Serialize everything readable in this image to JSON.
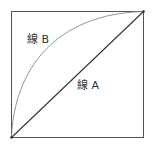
{
  "diagram": {
    "box": {
      "left": 11,
      "top": 11,
      "right": 144,
      "bottom": 138,
      "stroke": "#555555"
    },
    "line_a": {
      "label": "線 A",
      "stroke": "#333333",
      "label_x": 77,
      "label_y": 80
    },
    "line_b": {
      "label": "線 B",
      "stroke": "#777777",
      "label_x": 27,
      "label_y": 34
    }
  }
}
